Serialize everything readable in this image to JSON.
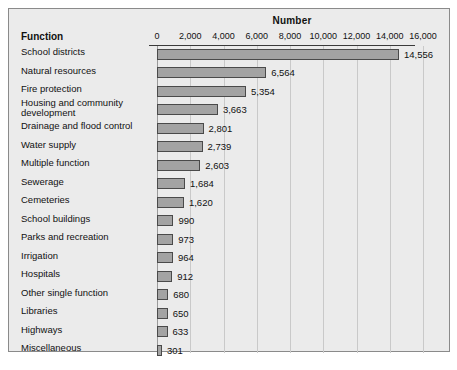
{
  "figure": {
    "axis_title": "Number",
    "category_header": "Function",
    "caption": ""
  },
  "chart_data": {
    "type": "bar",
    "orientation": "horizontal",
    "title": "Number",
    "xlabel": "Number",
    "ylabel": "Function",
    "xlim": [
      0,
      16000
    ],
    "grid": true,
    "legend": "none",
    "tick_labels": [
      "0",
      "2,000",
      "4,000",
      "6,000",
      "8,000",
      "10,000",
      "12,000",
      "14,000",
      "16,000"
    ],
    "ticks": [
      0,
      2000,
      4000,
      6000,
      8000,
      10000,
      12000,
      14000,
      16000
    ],
    "categories": [
      "School districts",
      "Natural resources",
      "Fire protection",
      "Housing and community development",
      "Drainage and flood control",
      "Water supply",
      "Multiple function",
      "Sewerage",
      "Cemeteries",
      "School buildings",
      "Parks and recreation",
      "Irrigation",
      "Hospitals",
      "Other single function",
      "Libraries",
      "Highways",
      "Miscellaneous"
    ],
    "values": [
      14556,
      6564,
      5354,
      3663,
      2801,
      2739,
      2603,
      1684,
      1620,
      990,
      973,
      964,
      912,
      680,
      650,
      633,
      301
    ],
    "value_labels": [
      "14,556",
      "6,564",
      "5,354",
      "3,663",
      "2,801",
      "2,739",
      "2,603",
      "1,684",
      "1,620",
      "990",
      "973",
      "964",
      "912",
      "680",
      "650",
      "633",
      "301"
    ],
    "colors": {
      "bar_fill": "#a3a3a3",
      "bar_edge": "#4a4a4a",
      "background": "#ebebeb",
      "gridline": "#c9c9c9",
      "axis": "#3a3a3a",
      "text": "#111111"
    }
  },
  "rows": [
    {
      "label": "School districts",
      "value_label": "14,556",
      "value": 14556,
      "wrap": false
    },
    {
      "label": "Natural resources",
      "value_label": "6,564",
      "value": 6564,
      "wrap": false
    },
    {
      "label": "Fire protection",
      "value_label": "5,354",
      "value": 5354,
      "wrap": false
    },
    {
      "label": "Housing and community\n    development",
      "value_label": "3,663",
      "value": 3663,
      "wrap": true
    },
    {
      "label": "Drainage and flood control",
      "value_label": "2,801",
      "value": 2801,
      "wrap": false
    },
    {
      "label": "Water supply",
      "value_label": "2,739",
      "value": 2739,
      "wrap": false
    },
    {
      "label": "Multiple function",
      "value_label": "2,603",
      "value": 2603,
      "wrap": false
    },
    {
      "label": "Sewerage",
      "value_label": "1,684",
      "value": 1684,
      "wrap": false
    },
    {
      "label": "Cemeteries",
      "value_label": "1,620",
      "value": 1620,
      "wrap": false
    },
    {
      "label": "School buildings",
      "value_label": "990",
      "value": 990,
      "wrap": false
    },
    {
      "label": "Parks and recreation",
      "value_label": "973",
      "value": 973,
      "wrap": false
    },
    {
      "label": "Irrigation",
      "value_label": "964",
      "value": 964,
      "wrap": false
    },
    {
      "label": "Hospitals",
      "value_label": "912",
      "value": 912,
      "wrap": false
    },
    {
      "label": "Other single function",
      "value_label": "680",
      "value": 680,
      "wrap": false
    },
    {
      "label": "Libraries",
      "value_label": "650",
      "value": 650,
      "wrap": false
    },
    {
      "label": "Highways",
      "value_label": "633",
      "value": 633,
      "wrap": false
    },
    {
      "label": "Miscellaneous",
      "value_label": "301",
      "value": 301,
      "wrap": false
    }
  ]
}
